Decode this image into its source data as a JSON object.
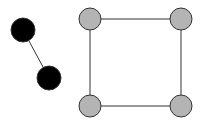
{
  "diagram": {
    "type": "graph",
    "components": [
      {
        "name": "black-pair",
        "nodes": [
          {
            "id": "b1",
            "x": 23,
            "y": 30,
            "r": 12,
            "fill": "#000000"
          },
          {
            "id": "b2",
            "x": 49,
            "y": 78,
            "r": 12,
            "fill": "#000000"
          }
        ],
        "edges": [
          [
            "b1",
            "b2"
          ]
        ]
      },
      {
        "name": "gray-square",
        "nodes": [
          {
            "id": "g1",
            "x": 90,
            "y": 19,
            "r": 11,
            "fill": "#b4b4b4"
          },
          {
            "id": "g2",
            "x": 181,
            "y": 19,
            "r": 11,
            "fill": "#b4b4b4"
          },
          {
            "id": "g3",
            "x": 90,
            "y": 106,
            "r": 11,
            "fill": "#b4b4b4"
          },
          {
            "id": "g4",
            "x": 181,
            "y": 106,
            "r": 11,
            "fill": "#b4b4b4"
          }
        ],
        "edges": [
          [
            "g1",
            "g2"
          ],
          [
            "g2",
            "g4"
          ],
          [
            "g4",
            "g3"
          ],
          [
            "g3",
            "g1"
          ]
        ]
      }
    ],
    "colors": {
      "edge": "#333333",
      "node_stroke": "#333333",
      "background": "#ffffff"
    }
  }
}
